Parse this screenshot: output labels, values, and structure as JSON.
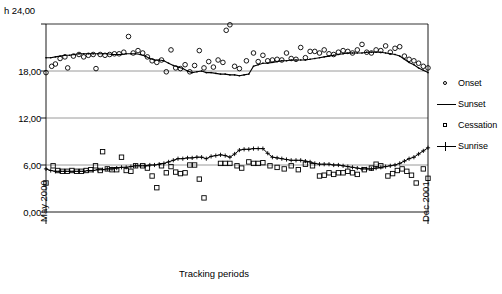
{
  "chart_data": {
    "type": "scatter",
    "title": "",
    "xlabel": "Tracking periods",
    "ylabel": "h 24,00",
    "yunit_label": "h 24,00",
    "ylim": [
      0,
      24
    ],
    "yticks": [
      "0,00",
      "6,00",
      "12,00",
      "18,00",
      "24,00"
    ],
    "ytick_values": [
      0,
      6,
      12,
      18,
      24
    ],
    "xticks": [
      "May 2000",
      "Dec 2001"
    ],
    "xlim_labels": [
      "May 2000",
      "Dec 2001"
    ],
    "grid": "horizontal",
    "legend_position": "right",
    "legend": [
      {
        "label": "Onset",
        "marker": "open-circle",
        "line": false
      },
      {
        "label": "Sunset",
        "marker": "none",
        "line": true
      },
      {
        "label": "Cessation",
        "marker": "open-square",
        "line": false
      },
      {
        "label": "Sunrise",
        "marker": "plus",
        "line": true
      }
    ],
    "series": [
      {
        "name": "Onset",
        "marker": "open-circle",
        "values": [
          17.8,
          18.6,
          18.9,
          19.6,
          19.8,
          18.4,
          19.9,
          20.1,
          19.8,
          20.0,
          20.1,
          18.3,
          20.1,
          20.0,
          20.1,
          20.2,
          20.2,
          20.4,
          22.4,
          20.3,
          20.6,
          20.3,
          19.8,
          19.3,
          19.1,
          19.4,
          17.9,
          20.7,
          18.4,
          18.3,
          18.8,
          17.9,
          18.7,
          20.6,
          18.4,
          19.2,
          18.5,
          19.4,
          19.1,
          23.2,
          23.9,
          18.6,
          18.3,
          19.3,
          20.3,
          19.2,
          20.0,
          19.3,
          19.4,
          19.5,
          19.4,
          20.3,
          19.6,
          19.5,
          21.0,
          19.7,
          20.5,
          20.5,
          20.3,
          20.7,
          20.2,
          20.1,
          20.4,
          20.6,
          20.5,
          20.3,
          20.7,
          21.4,
          20.4,
          20.3,
          20.7,
          20.6,
          21.2,
          20.4,
          20.9,
          21.1,
          19.9,
          19.5,
          19.3,
          19.0,
          18.6,
          18.4
        ]
      },
      {
        "name": "Sunset",
        "marker": "none",
        "line": true,
        "values": [
          19.7,
          19.7,
          19.8,
          19.9,
          20.0,
          20.0,
          20.1,
          20.2,
          20.2,
          20.2,
          20.2,
          20.2,
          20.2,
          20.2,
          20.1,
          20.1,
          20.1,
          20.2,
          20.2,
          20.2,
          20.1,
          19.9,
          19.6,
          19.4,
          19.4,
          19.3,
          19.0,
          18.7,
          18.5,
          18.3,
          18.0,
          17.8,
          17.9,
          18.0,
          17.8,
          17.8,
          17.7,
          17.6,
          17.6,
          17.5,
          17.5,
          17.4,
          17.5,
          17.6,
          18.6,
          18.8,
          19.0,
          19.0,
          19.1,
          19.2,
          19.3,
          19.3,
          19.4,
          19.4,
          19.4,
          19.4,
          19.5,
          19.6,
          19.7,
          19.8,
          19.9,
          20.0,
          20.1,
          20.2,
          20.3,
          20.3,
          20.3,
          20.3,
          20.4,
          20.4,
          20.4,
          20.4,
          20.3,
          20.2,
          20.1,
          19.9,
          19.5,
          19.1,
          18.8,
          18.4,
          18.1,
          17.8
        ]
      },
      {
        "name": "Cessation",
        "marker": "open-square",
        "values": [
          3.7,
          5.9,
          5.3,
          5.2,
          5.2,
          5.3,
          5.2,
          5.2,
          5.3,
          5.4,
          5.9,
          5.3,
          7.7,
          5.5,
          5.4,
          5.4,
          7.0,
          5.3,
          5.2,
          5.9,
          5.9,
          5.6,
          4.6,
          3.1,
          5.9,
          5.0,
          5.8,
          5.1,
          4.9,
          5.0,
          6.0,
          6.0,
          4.2,
          1.8,
          6.2,
          6.2,
          6.2,
          5.9,
          5.6,
          6.4,
          6.2,
          6.2,
          6.3,
          5.9,
          5.7,
          5.5,
          5.9,
          5.4,
          6.1,
          5.9,
          4.6,
          4.7,
          5.0,
          4.8,
          5.0,
          5.0,
          5.2,
          5.0,
          4.8,
          5.4,
          5.6,
          6.1,
          5.9,
          4.6,
          4.9,
          5.3,
          5.5,
          5.2,
          4.7,
          3.7,
          5.5,
          4.3
        ]
      },
      {
        "name": "Sunrise",
        "marker": "plus",
        "line": true,
        "values": [
          5.5,
          5.3,
          5.2,
          5.2,
          5.2,
          5.2,
          5.2,
          5.2,
          5.2,
          5.3,
          5.3,
          5.4,
          5.4,
          5.5,
          5.5,
          5.6,
          5.7,
          5.7,
          5.8,
          5.9,
          5.9,
          5.9,
          6.0,
          6.0,
          6.1,
          6.2,
          6.4,
          6.6,
          6.8,
          6.8,
          6.9,
          6.9,
          7.0,
          7.0,
          6.8,
          7.1,
          7.2,
          7.3,
          7.2,
          7.0,
          7.4,
          7.9,
          8.0,
          8.0,
          8.1,
          8.1,
          8.1,
          7.5,
          7.0,
          6.9,
          6.8,
          6.7,
          6.6,
          6.6,
          6.6,
          6.5,
          6.4,
          6.2,
          6.1,
          6.1,
          6.1,
          6.0,
          6.0,
          5.9,
          5.8,
          5.7,
          5.6,
          5.5,
          5.5,
          5.5,
          5.6,
          5.7,
          5.8,
          5.9,
          6.0,
          6.2,
          6.5,
          6.8,
          7.0,
          7.4,
          7.8,
          8.2
        ]
      }
    ],
    "onset_x": [
      0.0,
      1.2,
      2.0,
      3.0,
      4.0,
      4.6,
      5.8,
      7.0,
      8.0,
      9.0,
      10.0,
      10.6,
      11.5,
      12.5,
      13.5,
      14.5,
      15.5,
      16.5,
      17.5,
      18.5,
      19.5,
      20.5,
      21.5,
      22.5,
      23.5,
      24.5,
      25.5,
      26.5,
      27.5,
      28.5,
      29.5,
      30.5,
      31.5,
      32.5,
      33.5,
      34.5,
      35.5,
      36.5,
      37.5,
      38.2,
      39.0,
      40.0,
      41.0,
      42.5,
      44.0,
      45.0,
      46.0,
      47.0,
      48.0,
      49.0,
      50.0,
      51.0,
      52.0,
      53.0,
      54.0,
      55.0,
      56.0,
      57.0,
      58.0,
      59.0,
      60.0,
      61.0,
      62.0,
      63.0,
      64.0,
      65.0,
      66.0,
      67.0,
      68.0,
      69.0,
      70.0,
      71.0,
      72.0,
      73.0,
      74.0,
      75.0,
      76.0,
      77.0,
      78.0,
      79.0,
      80.0,
      81.0
    ],
    "cessation_x": [
      0.0,
      1.5,
      2.5,
      3.5,
      4.5,
      5.5,
      6.5,
      7.5,
      8.5,
      9.5,
      10.5,
      11.5,
      12.0,
      13.0,
      14.0,
      15.0,
      16.0,
      17.0,
      18.0,
      19.0,
      20.5,
      21.5,
      22.5,
      23.5,
      24.5,
      25.5,
      26.5,
      27.5,
      28.5,
      29.5,
      30.5,
      31.5,
      32.5,
      33.5,
      37.0,
      38.0,
      39.0,
      40.5,
      41.5,
      43.0,
      44.0,
      45.0,
      46.0,
      47.5,
      49.0,
      50.5,
      52.0,
      53.5,
      55.0,
      56.5,
      58.0,
      59.0,
      60.0,
      61.0,
      62.0,
      63.0,
      64.0,
      65.0,
      66.0,
      67.5,
      69.0,
      70.0,
      71.0,
      72.5,
      73.5,
      74.5,
      75.5,
      76.5,
      77.5,
      78.5,
      80.0,
      81.0
    ]
  },
  "axis": {
    "unit_label": "h 24,00",
    "ytick_0": "0,00",
    "ytick_6": "6,00",
    "ytick_12": "12,00",
    "ytick_18": "18,00",
    "xlabel_left": "May 2000",
    "xlabel_right": "Dec 2001",
    "xtitle": "Tracking periods"
  },
  "legend": {
    "items": [
      {
        "label": "Onset"
      },
      {
        "label": "Sunset"
      },
      {
        "label": "Cessation"
      },
      {
        "label": "Sunrise"
      }
    ]
  }
}
